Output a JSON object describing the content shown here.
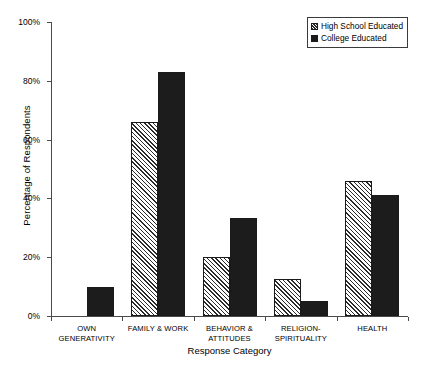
{
  "chart_data": {
    "type": "bar",
    "title": "",
    "xlabel": "Response Category",
    "ylabel": "Percentage of Respondents",
    "ylim": [
      0,
      100
    ],
    "ytick_labels": [
      "0%",
      "20%",
      "40%",
      "60%",
      "80%",
      "100%"
    ],
    "ytick_values": [
      0,
      20,
      40,
      60,
      80,
      100
    ],
    "grid": false,
    "legend_position": "top-right",
    "categories": [
      "OWN\nGENERATIVITY",
      "FAMILY & WORK",
      "BEHAVIOR &\nATTITUDES",
      "RELIGION-\nSPIRITUALITY",
      "HEALTH"
    ],
    "series": [
      {
        "name": "High School Educated",
        "pattern": "hatched",
        "values": [
          0,
          66,
          20,
          12.5,
          46
        ]
      },
      {
        "name": "College Educated",
        "pattern": "solid",
        "color": "#1c1c1c",
        "values": [
          10,
          83,
          33.5,
          5,
          41
        ]
      }
    ]
  },
  "legend": {
    "items": [
      {
        "label": "High School Educated",
        "style": "hatch"
      },
      {
        "label": "College Educated",
        "style": "solid"
      }
    ]
  }
}
